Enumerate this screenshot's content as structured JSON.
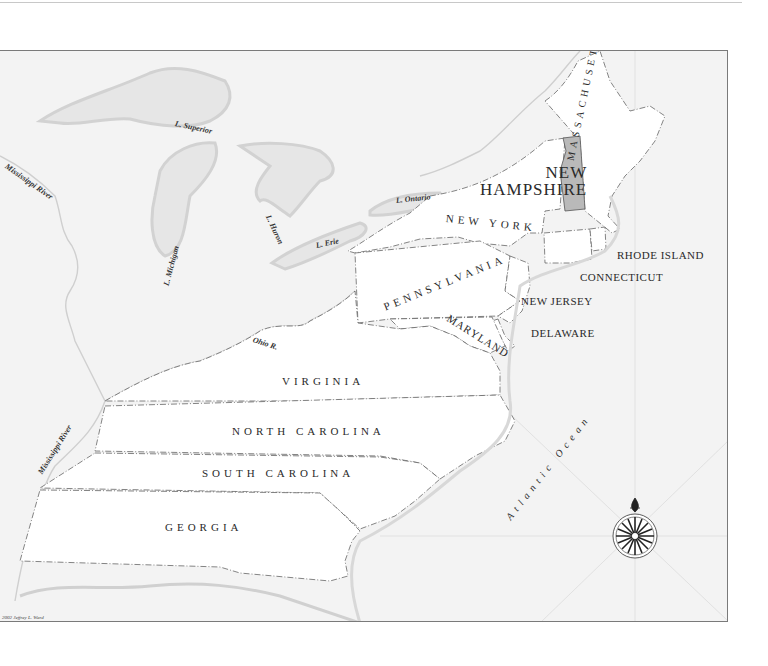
{
  "map": {
    "highlighted_colony": "New Hampshire",
    "colors": {
      "outer_land": "#f3f3f3",
      "colony_fill": "#ffffff",
      "highlight_fill": "#b9b9b9",
      "water_halo": "#d9d9d9",
      "border_line": "#555555",
      "frame": "#7a7a7a"
    },
    "colonies": [
      {
        "id": "new-hampshire",
        "label_line1": "NEW",
        "label_line2": "HAMPSHIRE"
      },
      {
        "id": "massachusetts",
        "label": "MASSACHUSETTS"
      },
      {
        "id": "new-york",
        "label": "NEW YORK"
      },
      {
        "id": "rhode-island",
        "label": "RHODE ISLAND"
      },
      {
        "id": "connecticut",
        "label": "CONNECTICUT"
      },
      {
        "id": "pennsylvania",
        "label": "PENNSYLVANIA"
      },
      {
        "id": "new-jersey",
        "label": "NEW JERSEY"
      },
      {
        "id": "delaware",
        "label": "DELAWARE"
      },
      {
        "id": "maryland",
        "label": "MARYLAND"
      },
      {
        "id": "virginia",
        "label": "VIRGINIA"
      },
      {
        "id": "north-carolina",
        "label": "NORTH CAROLINA"
      },
      {
        "id": "south-carolina",
        "label": "SOUTH CAROLINA"
      },
      {
        "id": "georgia",
        "label": "GEORGIA"
      }
    ],
    "water_labels": {
      "superior": "L. Superior",
      "michigan": "L. Michigan",
      "huron": "L. Huron",
      "erie": "L. Erie",
      "ontario": "L. Ontario",
      "mississippi_north": "Mississippi River",
      "mississippi_south": "Mississippi River",
      "ohio": "Ohio R.",
      "atlantic": "Atlantic Ocean"
    },
    "compass": {
      "icon": "compass-rose-icon",
      "north_marker": "fleur-de-lis"
    },
    "credit": "2002 Jeffrey L. Ward"
  }
}
